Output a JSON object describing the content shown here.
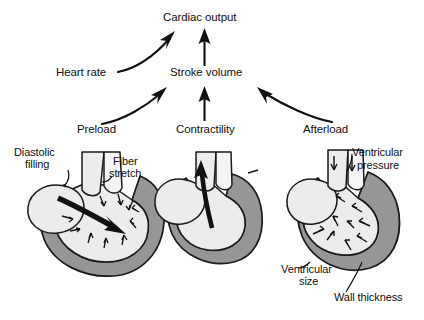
{
  "diagram": {
    "type": "flow-diagram",
    "colors": {
      "background": "#ffffff",
      "text": "#111111",
      "heart_wall": "#969696",
      "heart_chamber": "#ececec",
      "heart_outline": "#1a1a1a",
      "arrow": "#111111"
    },
    "nodes": {
      "cardiac_output": "Cardiac output",
      "heart_rate": "Heart rate",
      "stroke_volume": "Stroke volume",
      "preload": "Preload",
      "contractility": "Contractility",
      "afterload": "Afterload"
    },
    "annotations": {
      "diastolic_filling_line1": "Diastolic",
      "diastolic_filling_line2": "filling",
      "fiber_stretch_line1": "Fiber",
      "fiber_stretch_line2": "stretch",
      "ventricular_pressure_line1": "Ventricular",
      "ventricular_pressure_line2": "pressure",
      "ventricular_size_line1": "Ventricular",
      "ventricular_size_line2": "size",
      "wall_thickness": "Wall thickness"
    },
    "edges": [
      {
        "from": "Heart rate",
        "to": "Cardiac output",
        "style": "curved-arrow"
      },
      {
        "from": "Stroke volume",
        "to": "Cardiac output",
        "style": "straight-arrow"
      },
      {
        "from": "Preload",
        "to": "Stroke volume",
        "style": "curved-arrow"
      },
      {
        "from": "Contractility",
        "to": "Stroke volume",
        "style": "straight-arrow"
      },
      {
        "from": "Afterload",
        "to": "Stroke volume",
        "style": "curved-arrow"
      }
    ],
    "illustrations": [
      {
        "name": "preload-heart",
        "caption_labels": [
          "Diastolic filling",
          "Fiber stretch"
        ],
        "state": "dilated, thin wall, filling arrow inward"
      },
      {
        "name": "contractility-heart",
        "caption_labels": [],
        "state": "ejecting, upward outflow arrow"
      },
      {
        "name": "afterload-heart",
        "caption_labels": [
          "Ventricular pressure",
          "Ventricular size",
          "Wall thickness"
        ],
        "state": "contracted, thick wall, inward pressure arrows"
      }
    ]
  }
}
